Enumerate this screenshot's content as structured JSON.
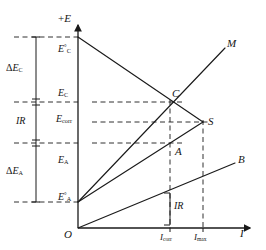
{
  "figure": {
    "type": "evans-polarization-diagram",
    "axes": {
      "y_axis_label": "+E",
      "x_axis_label": "I",
      "origin_label": "O"
    },
    "potential_ticks": [
      {
        "id": "E_C_std",
        "symbol": "E",
        "superscript": "°",
        "subscript": "C",
        "y": 37
      },
      {
        "id": "E_C",
        "symbol": "E",
        "superscript": "",
        "subscript": "C",
        "y": 102
      },
      {
        "id": "E_corr",
        "symbol": "E",
        "superscript": "",
        "subscript": "corr",
        "y": 122
      },
      {
        "id": "E_A",
        "symbol": "E",
        "superscript": "",
        "subscript": "A",
        "y": 143
      },
      {
        "id": "E_A_std",
        "symbol": "E",
        "superscript": "°",
        "subscript": "A",
        "y": 202
      }
    ],
    "current_ticks": [
      {
        "id": "I_corr",
        "symbol": "I",
        "subscript": "corr",
        "x": 170
      },
      {
        "id": "I_max",
        "symbol": "I",
        "subscript": "max",
        "x": 203
      }
    ],
    "brackets": [
      {
        "id": "delta-E-C",
        "label": "ΔE",
        "subscript": "C"
      },
      {
        "id": "IR-drop",
        "label": "IR",
        "subscript": ""
      },
      {
        "id": "delta-E-A",
        "label": "ΔE",
        "subscript": "A"
      }
    ],
    "curve_endpoints": [
      {
        "id": "M",
        "label": "M"
      },
      {
        "id": "S",
        "label": "S"
      },
      {
        "id": "B",
        "label": "B"
      }
    ],
    "points": [
      {
        "id": "C",
        "label": "C"
      },
      {
        "id": "A",
        "label": "A"
      }
    ],
    "inner_annotation": {
      "id": "IR-segment",
      "label": "IR"
    },
    "colors": {
      "line": "#1a1a1a",
      "dashed": "#1a1a1a",
      "background": "#ffffff",
      "text": "#161616"
    }
  }
}
